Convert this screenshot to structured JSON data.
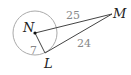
{
  "diagram": {
    "type": "circle-tangent",
    "points": {
      "N": {
        "label": "N",
        "x": 35,
        "y": 33
      },
      "L": {
        "label": "L",
        "x": 45,
        "y": 53
      },
      "M": {
        "label": "M",
        "x": 112,
        "y": 14
      }
    },
    "circle": {
      "center": "N",
      "radius": 22,
      "stroke": "#aaaaaa"
    },
    "segments": [
      {
        "from": "N",
        "to": "M",
        "length_label": "25"
      },
      {
        "from": "L",
        "to": "M",
        "length_label": "24"
      },
      {
        "from": "N",
        "to": "L",
        "length_label": "7"
      }
    ],
    "colors": {
      "line": "#444444",
      "circle": "#aaaaaa",
      "numbers": "#888888"
    }
  }
}
